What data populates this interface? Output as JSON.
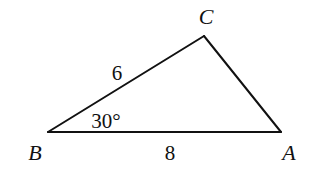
{
  "diagram": {
    "type": "triangle",
    "stroke_color": "#111111",
    "background": "#ffffff",
    "vertices": [
      {
        "name": "B",
        "x": 48,
        "y": 132,
        "label_x": 35,
        "label_y": 160
      },
      {
        "name": "C",
        "x": 204,
        "y": 36,
        "label_x": 206,
        "label_y": 24
      },
      {
        "name": "A",
        "x": 281,
        "y": 132,
        "label_x": 289,
        "label_y": 160
      }
    ],
    "sides": [
      {
        "from": "B",
        "to": "C",
        "length_label": "6",
        "label_x": 117,
        "label_y": 80
      },
      {
        "from": "B",
        "to": "A",
        "length_label": "8",
        "label_x": 170,
        "label_y": 160
      },
      {
        "from": "C",
        "to": "A",
        "length_label": ""
      }
    ],
    "angles": [
      {
        "at": "B",
        "label": "30°",
        "label_x": 106,
        "label_y": 128
      }
    ]
  }
}
